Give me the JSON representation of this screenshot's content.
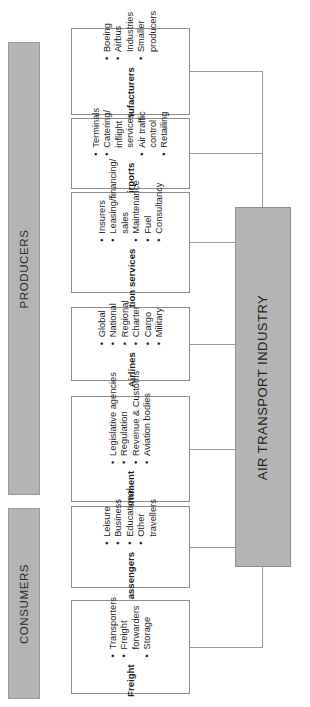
{
  "diagram": {
    "hub": {
      "label": "AIR TRANSPORT INDUSTRY"
    },
    "groups": [
      {
        "id": "producers",
        "label": "PRODUCERS"
      },
      {
        "id": "consumers",
        "label": "CONSUMERS"
      }
    ],
    "boxes": [
      {
        "id": "manufacturers",
        "group": "producers",
        "title": "Manufacturers",
        "items": [
          {
            "text": "Boeing",
            "bullet": true
          },
          {
            "text": "Airbus",
            "bullet": true
          },
          {
            "text": "Industries",
            "bullet": false
          },
          {
            "text": "Smaller",
            "bullet": true
          },
          {
            "text": "producers",
            "bullet": false
          }
        ]
      },
      {
        "id": "airports",
        "group": "producers",
        "title": "Airports",
        "items": [
          {
            "text": "Terminals",
            "bullet": true
          },
          {
            "text": "Catering/",
            "bullet": true
          },
          {
            "text": "inflight",
            "bullet": false
          },
          {
            "text": "services",
            "bullet": false
          },
          {
            "text": "Air traffic",
            "bullet": true
          },
          {
            "text": "control",
            "bullet": false
          },
          {
            "text": "Retailing",
            "bullet": true
          }
        ]
      },
      {
        "id": "aviation-services",
        "group": "producers",
        "title": "Aviation services",
        "items": [
          {
            "text": "Insurers",
            "bullet": true
          },
          {
            "text": "Leasing/financing/",
            "bullet": true
          },
          {
            "text": "sales",
            "bullet": false
          },
          {
            "text": "Maintenance",
            "bullet": true
          },
          {
            "text": "Fuel",
            "bullet": true
          },
          {
            "text": "Consultancy",
            "bullet": true
          }
        ]
      },
      {
        "id": "airlines",
        "group": "producers",
        "title": "Airlines",
        "items": [
          {
            "text": "Global",
            "bullet": true
          },
          {
            "text": "National",
            "bullet": true
          },
          {
            "text": "Regional",
            "bullet": true
          },
          {
            "text": "Charter",
            "bullet": true
          },
          {
            "text": "Cargo",
            "bullet": true
          },
          {
            "text": "Military",
            "bullet": true
          }
        ]
      },
      {
        "id": "government",
        "group": "producers",
        "title": "Government",
        "items": [
          {
            "text": "Legislative agencies",
            "bullet": true
          },
          {
            "text": "Regulation",
            "bullet": true
          },
          {
            "text": "Revenue & Customs",
            "bullet": true
          },
          {
            "text": "Aviation bodies",
            "bullet": true
          }
        ]
      },
      {
        "id": "passengers",
        "group": "consumers",
        "title": "Passengers",
        "items": [
          {
            "text": "Leisure",
            "bullet": true
          },
          {
            "text": "Business",
            "bullet": true
          },
          {
            "text": "Educational",
            "bullet": true
          },
          {
            "text": "Other",
            "bullet": true
          },
          {
            "text": "travellers",
            "bullet": false
          }
        ]
      },
      {
        "id": "freight",
        "group": "consumers",
        "title": "Freight",
        "items": [
          {
            "text": "Transporters",
            "bullet": true
          },
          {
            "text": "Freight",
            "bullet": true
          },
          {
            "text": "forwarders",
            "bullet": false
          },
          {
            "text": "Storage",
            "bullet": true
          }
        ]
      }
    ],
    "colors": {
      "banner_fill": "#b4b4b4",
      "hub_fill": "#b4b4b4",
      "box_fill": "#ffffff",
      "stroke": "#8d8d8d",
      "text": "#1d1d1d"
    }
  }
}
